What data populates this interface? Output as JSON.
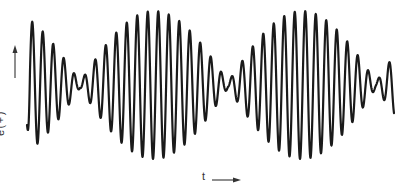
{
  "figure": {
    "type": "waveform-diagram",
    "y_axis_label": "e(+)",
    "x_axis_label": "t",
    "line_color": "#1a1a1a",
    "background": "#ffffff"
  },
  "waveform": {
    "x_start": 27,
    "x_end": 394,
    "baseline_y": 85,
    "carrier_period_px": 10.5,
    "envelope_nodes_x": [
      80,
      228,
      376
    ],
    "envelope_maxima_x": [
      155,
      302
    ],
    "max_amplitude_px": 74,
    "residual_amplitude_px": 3
  }
}
